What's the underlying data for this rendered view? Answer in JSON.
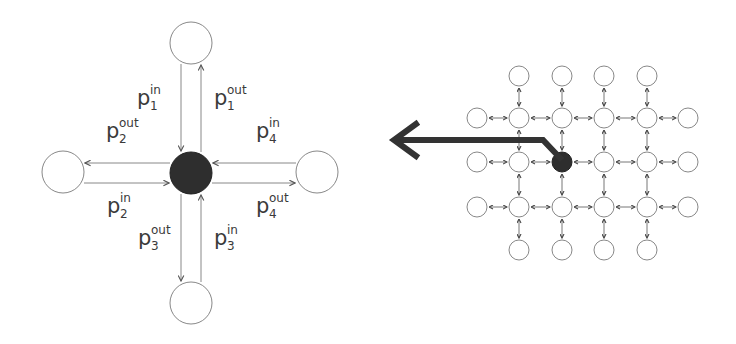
{
  "diagram": {
    "left": {
      "description": "Single node with four neighbors and in/out ports",
      "center_node": {
        "cx": 191,
        "cy": 173,
        "r": 21,
        "fill": "#2e2e2e"
      },
      "neighbors": [
        {
          "name": "north",
          "cx": 191,
          "cy": 43,
          "r": 21
        },
        {
          "name": "west",
          "cx": 63,
          "cy": 172,
          "r": 21
        },
        {
          "name": "east",
          "cx": 317,
          "cy": 172,
          "r": 21
        },
        {
          "name": "south",
          "cx": 191,
          "cy": 303,
          "r": 21
        }
      ],
      "labels": [
        {
          "id": "p1in",
          "base": "p",
          "sub": "1",
          "sup": "in",
          "x": 137,
          "y": 88
        },
        {
          "id": "p1out",
          "base": "p",
          "sub": "1",
          "sup": "out",
          "x": 214,
          "y": 88
        },
        {
          "id": "p2out",
          "base": "p",
          "sub": "2",
          "sup": "out",
          "x": 106,
          "y": 121
        },
        {
          "id": "p4in",
          "base": "p",
          "sub": "4",
          "sup": "in",
          "x": 256,
          "y": 121
        },
        {
          "id": "p2in",
          "base": "p",
          "sub": "2",
          "sup": "in",
          "x": 107,
          "y": 196
        },
        {
          "id": "p4out",
          "base": "p",
          "sub": "4",
          "sup": "out",
          "x": 256,
          "y": 196
        },
        {
          "id": "p3out",
          "base": "p",
          "sub": "3",
          "sup": "out",
          "x": 138,
          "y": 228
        },
        {
          "id": "p3in",
          "base": "p",
          "sub": "3",
          "sup": "in",
          "x": 214,
          "y": 228
        }
      ]
    },
    "right": {
      "description": "Grid of nodes with bidirectional links; highlighted node sends to the left",
      "columns_x": [
        519,
        562,
        604,
        647
      ],
      "rows_y": [
        118,
        162,
        207
      ],
      "top_row_y": 76,
      "bottom_row_y": 250,
      "left_col_x": 477,
      "right_col_x": 688,
      "node_r": 10,
      "highlight_node": {
        "col": 1,
        "row": 1
      },
      "big_arrow": {
        "tip": [
          392,
          140
        ],
        "bend": [
          543,
          140
        ],
        "end": [
          562,
          160
        ],
        "color": "#333333"
      }
    }
  },
  "colors": {
    "stroke": "#8a8a8a",
    "arrow": "#555555",
    "dark_node": "#2e2e2e",
    "text": "#3a3a3a"
  }
}
